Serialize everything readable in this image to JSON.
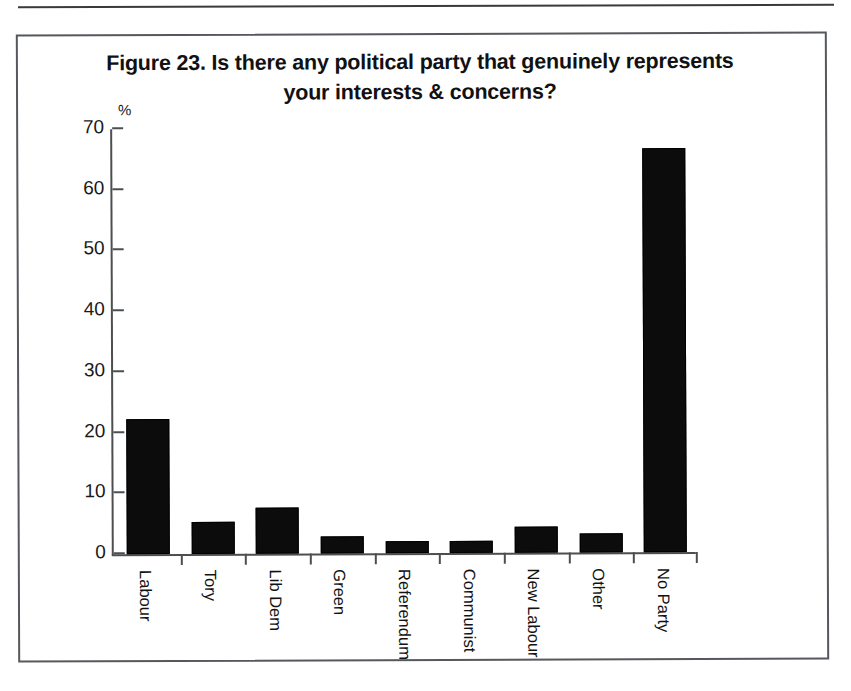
{
  "figure": {
    "title_line1": "Figure 23. Is there any political party that genuinely represents",
    "title_line2": "your interests & concerns?"
  },
  "chart_data": {
    "type": "bar",
    "title": "Figure 23. Is there any political party that genuinely represents your interests & concerns?",
    "xlabel": "",
    "ylabel": "%",
    "y_unit": "%",
    "ylim": [
      0,
      70
    ],
    "y_ticks": [
      0,
      10,
      20,
      30,
      40,
      50,
      60,
      70
    ],
    "grid": false,
    "legend": false,
    "bar_color": "#0c0c0c",
    "categories": [
      "Labour",
      "Tory",
      "Lib Dem",
      "Green",
      "Referendum",
      "Communist",
      "New Labour",
      "Other",
      "No Party"
    ],
    "values": [
      22.2,
      5.3,
      7.6,
      2.8,
      2.0,
      2.0,
      4.3,
      3.2,
      66.6
    ]
  }
}
